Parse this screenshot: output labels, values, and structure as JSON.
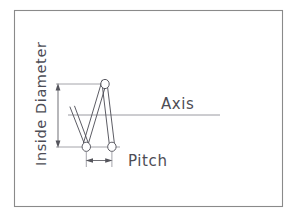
{
  "diagram": {
    "background_color": "#ffffff",
    "line_color": "#4a4a52",
    "axis_color": "#8e8e96",
    "border_color": "#8a8a8a",
    "text_color": "#4d4d55",
    "labels": {
      "inside_diameter": "Inside Diameter",
      "axis": "Axis",
      "pitch": "Pitch"
    },
    "border": {
      "x": 14,
      "y": 10,
      "width": 269,
      "height": 197
    },
    "axis": {
      "y": 115,
      "x_start": 68,
      "x_end": 220
    },
    "spring": {
      "apex": {
        "x": 105,
        "y": 84
      },
      "bottom_left": {
        "x": 86,
        "y": 147
      },
      "bottom_right": {
        "x": 112,
        "y": 147
      },
      "wire_end_radius": 4.0,
      "partial_leg_top": {
        "x": 70,
        "y": 107
      }
    },
    "dimensions": {
      "inside_diameter": {
        "x": 58,
        "y_top": 84,
        "y_bottom": 147
      },
      "pitch": {
        "y": 160,
        "x_left": 86,
        "x_right": 112
      }
    }
  }
}
